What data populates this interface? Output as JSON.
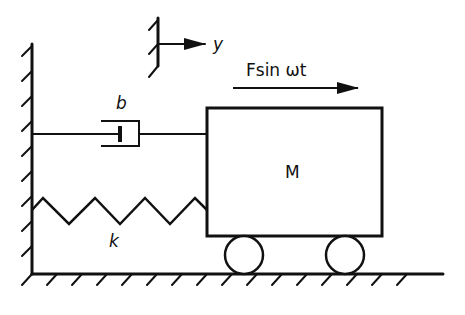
{
  "diagram": {
    "colors": {
      "ink": "#111111",
      "background": "#ffffff"
    },
    "labels": {
      "mass": "M",
      "damper": "b",
      "spring": "k",
      "force": "Fsin ωt",
      "displacement": "y"
    },
    "components": [
      {
        "id": "wall",
        "type": "fixed-support-vertical"
      },
      {
        "id": "ground",
        "type": "fixed-support-horizontal"
      },
      {
        "id": "damper",
        "type": "dashpot",
        "label_ref": "b"
      },
      {
        "id": "spring",
        "type": "spring",
        "label_ref": "k"
      },
      {
        "id": "mass",
        "type": "block",
        "label_ref": "M"
      },
      {
        "id": "wheel-left",
        "type": "roller"
      },
      {
        "id": "wheel-right",
        "type": "roller"
      },
      {
        "id": "force-arrow",
        "type": "arrow",
        "label_ref": "Fsin ωt"
      },
      {
        "id": "reference-frame",
        "type": "coordinate-arrow",
        "label_ref": "y"
      }
    ]
  }
}
